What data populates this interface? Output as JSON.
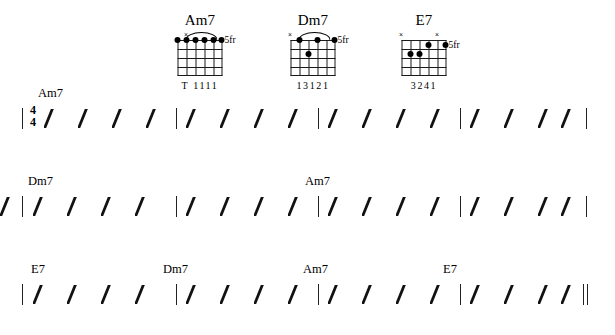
{
  "document": {
    "type": "guitar-chord-chart",
    "title": ""
  },
  "chord_diagrams": [
    {
      "name": "Am7",
      "fret_label": "5fr",
      "fingering": "T 1111",
      "x_markers": [
        1
      ],
      "barre": {
        "from_string": 1,
        "to_string": 5,
        "fret": 1
      },
      "dots": [
        {
          "string": 0,
          "fret": 1
        },
        {
          "string": 1,
          "fret": 1
        },
        {
          "string": 2,
          "fret": 1
        },
        {
          "string": 3,
          "fret": 1
        },
        {
          "string": 4,
          "fret": 1
        },
        {
          "string": 5,
          "fret": 1
        }
      ]
    },
    {
      "name": "Dm7",
      "fret_label": "5fr",
      "fingering": "13121",
      "x_markers": [
        0
      ],
      "barre": {
        "from_string": 1,
        "to_string": 5,
        "fret": 1
      },
      "dots": [
        {
          "string": 1,
          "fret": 1
        },
        {
          "string": 3,
          "fret": 1
        },
        {
          "string": 5,
          "fret": 1
        },
        {
          "string": 2,
          "fret": 2
        }
      ]
    },
    {
      "name": "E7",
      "fret_label": "5fr",
      "fingering": "3241",
      "x_markers": [
        0,
        4
      ],
      "barre": null,
      "dots": [
        {
          "string": 5,
          "fret": 1
        },
        {
          "string": 1,
          "fret": 2
        },
        {
          "string": 2,
          "fret": 2
        },
        {
          "string": 3,
          "fret": 2
        }
      ]
    }
  ],
  "staff": {
    "time_signature": {
      "top": "4",
      "bottom": "4"
    },
    "slashes_per_measure": 4,
    "systems": [
      {
        "index": 1,
        "chords": [
          {
            "label": "Am7",
            "measure": 1
          }
        ],
        "measures": 4,
        "end_barline": "single"
      },
      {
        "index": 2,
        "chords": [
          {
            "label": "Dm7",
            "measure": 1
          },
          {
            "label": "Am7",
            "measure": 3
          }
        ],
        "measures": 4,
        "end_barline": "single"
      },
      {
        "index": 3,
        "chords": [
          {
            "label": "E7",
            "measure": 1
          },
          {
            "label": "Dm7",
            "measure": 2
          },
          {
            "label": "Am7",
            "measure": 3
          },
          {
            "label": "E7",
            "measure": 4
          }
        ],
        "measures": 4,
        "end_barline": "final"
      }
    ]
  },
  "colors": {
    "ink": "#000000",
    "paper": "#ffffff"
  }
}
